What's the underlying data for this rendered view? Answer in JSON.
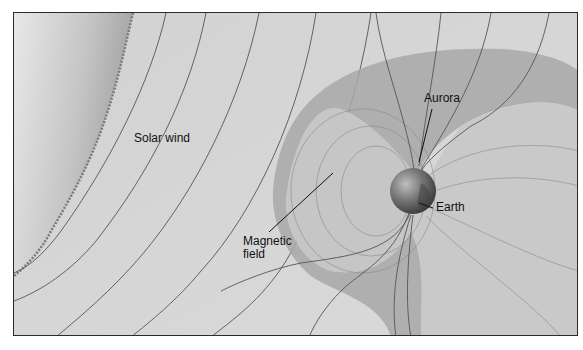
{
  "diagram": {
    "labels": {
      "solar_wind": "Solar wind",
      "aurora": "Aurora",
      "earth": "Earth",
      "magnetic_field_line1": "Magnetic",
      "magnetic_field_line2": "field"
    },
    "colors": {
      "background": "#d6d6d6",
      "sun": "#bdbdbd",
      "magnetosheath": "#a8a8a8",
      "field_lines": "#555555",
      "earth": "#6e6e6e",
      "frame": "#2a2a2a"
    }
  }
}
